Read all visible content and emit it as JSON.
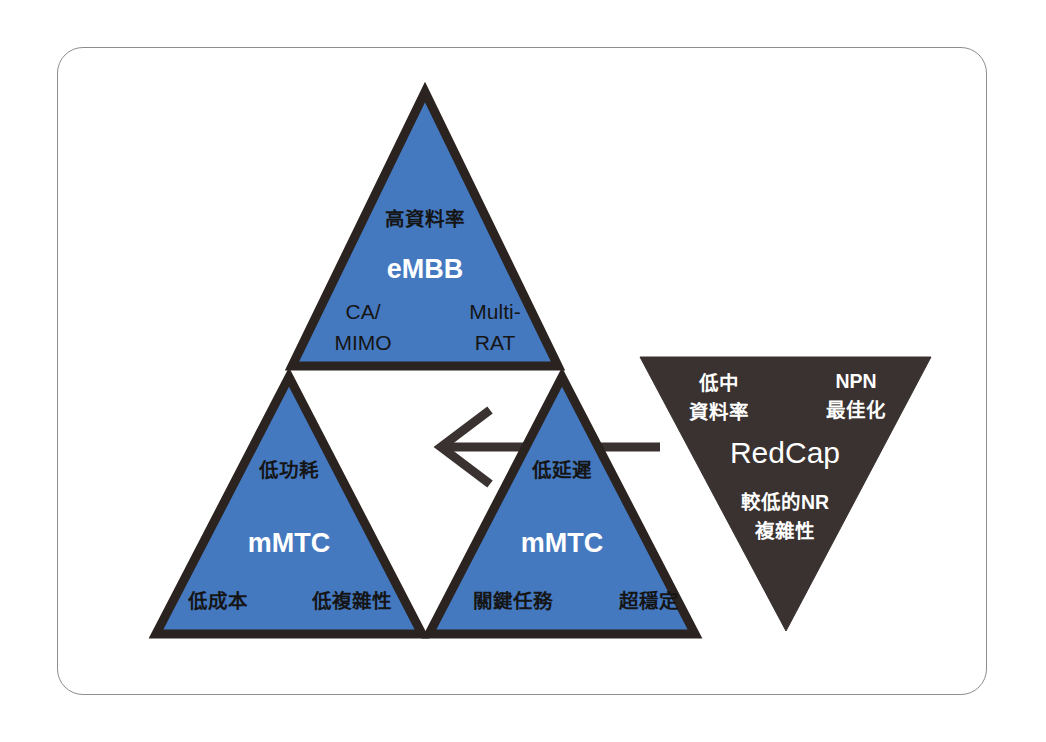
{
  "figure": {
    "colors": {
      "blue_fill": "#4478bf",
      "dark_fill": "#393230",
      "outline": "#2b2320",
      "frame_border": "#8d8d8d",
      "background": "#ffffff",
      "label_dark": "#151515",
      "label_light": "#ffffff"
    },
    "triangles": [
      {
        "id": "embb",
        "name": "eMBB",
        "fill": "blue",
        "orientation": "up",
        "center_label": "eMBB",
        "top_label": "高資料率",
        "bottom_left_label_line1": "CA/",
        "bottom_left_label_line2": "MIMO",
        "bottom_right_label_line1": "Multi-",
        "bottom_right_label_line2": "RAT"
      },
      {
        "id": "mmtc-left",
        "name": "mMTC",
        "fill": "blue",
        "orientation": "up",
        "center_label": "mMTC",
        "top_label": "低功耗",
        "bottom_left_label": "低成本",
        "bottom_right_label": "低複雜性"
      },
      {
        "id": "mmtc-right",
        "name": "mMTC",
        "fill": "blue",
        "orientation": "up",
        "center_label": "mMTC",
        "top_label": "低延遲",
        "bottom_left_label": "關鍵任務",
        "bottom_right_label": "超穩定"
      },
      {
        "id": "redcap",
        "name": "RedCap",
        "fill": "dark",
        "orientation": "down",
        "center_label": "RedCap",
        "top_left_label_line1": "低中",
        "top_left_label_line2": "資料率",
        "top_right_label_line1": "NPN",
        "top_right_label_line2": "最佳化",
        "bottom_label_line1": "較低的NR",
        "bottom_label_line2": "複雜性"
      }
    ],
    "arrow": {
      "id": "redcap-to-core-arrow",
      "direction": "left",
      "color": "#393230"
    }
  }
}
